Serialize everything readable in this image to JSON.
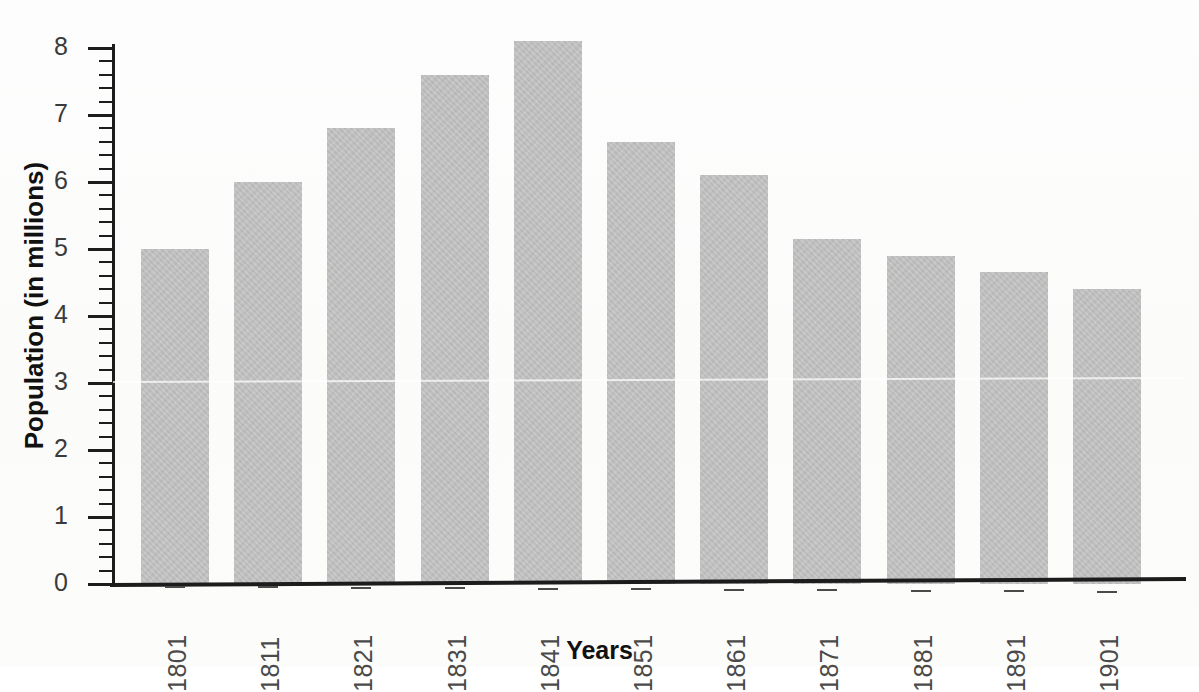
{
  "chart_data": {
    "type": "bar",
    "title": "",
    "xlabel": "Years",
    "ylabel": "Population (in millions)",
    "categories": [
      "1801",
      "1811",
      "1821",
      "1831",
      "1841",
      "1851",
      "1861",
      "1871",
      "1881",
      "1891",
      "1901"
    ],
    "values": [
      5.0,
      6.0,
      6.8,
      7.6,
      8.1,
      6.6,
      6.1,
      5.15,
      4.9,
      4.65,
      4.4
    ],
    "ylim": [
      0,
      8.2
    ],
    "y_tick_labels": [
      "0",
      "1",
      "2",
      "3",
      "4",
      "5",
      "6",
      "7",
      "8"
    ],
    "y_major_ticks": [
      0,
      1,
      2,
      3,
      4,
      5,
      6,
      7,
      8
    ],
    "y_minor_tick_step": 0.2,
    "grid": false,
    "legend": false,
    "legend_position": "none",
    "bar_color": "#c3c3c3",
    "axis_color": "#1c1c1c",
    "label_color": "#4a4a4a",
    "x_tick_label_rotation": -90
  },
  "axes": {
    "x_title": "Years",
    "y_title": "Population (in millions)"
  }
}
